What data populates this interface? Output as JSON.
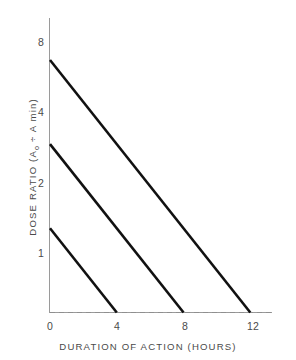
{
  "chart_data": {
    "type": "line",
    "title": "",
    "xlabel": "DURATION OF ACTION (HOURS)",
    "ylabel": "DOSE RATIO (A₀ ÷ Amin)",
    "ylabel_parts": {
      "lead": "DOSE RATIO (A",
      "subscript": "o",
      "mid": " ÷ A min)"
    },
    "xlim": [
      0,
      13.3
    ],
    "ylim": [
      1,
      11.3
    ],
    "yscale": "log2",
    "grid": false,
    "legend": "none",
    "xticks": [
      0,
      4,
      8,
      12
    ],
    "xtick_labels": [
      "0",
      "4",
      "8",
      "12"
    ],
    "yticks": [
      1,
      2,
      4,
      8
    ],
    "ytick_labels": [
      "1",
      "2",
      "4",
      "8"
    ],
    "reference_line": {
      "label": "dose ratio = 1",
      "y": 1,
      "style": "dashed",
      "x_start": 0,
      "x_end": 13.3
    },
    "series": [
      {
        "name": "initial dose ratio 8",
        "points": [
          [
            0,
            8
          ],
          [
            12,
            1
          ]
        ],
        "start_dose_ratio": 8,
        "duration_hours": 12
      },
      {
        "name": "initial dose ratio 4",
        "points": [
          [
            0,
            4
          ],
          [
            8,
            1
          ]
        ],
        "start_dose_ratio": 4,
        "duration_hours": 8
      },
      {
        "name": "initial dose ratio 2",
        "points": [
          [
            0,
            2
          ],
          [
            4,
            1
          ]
        ],
        "start_dose_ratio": 2,
        "duration_hours": 4
      }
    ],
    "colors": {
      "series": "#111111",
      "axis": "#9a9a9a",
      "reference": "#8f8f8f",
      "text": "#4a4a4a",
      "background": "#ffffff"
    }
  }
}
